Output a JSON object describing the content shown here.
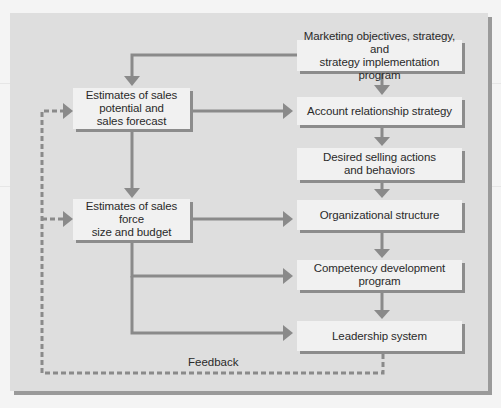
{
  "diagram": {
    "title": "",
    "colors": {
      "page_background": "#f4f4f4",
      "panel_background": "#dedede",
      "panel_shadow": "#9a9a9a",
      "box_fill": "#f1f1f1",
      "box_shadow": "#8c8c8c",
      "arrow": "#8a8a8a",
      "text": "#2a2a2a"
    },
    "nodes": {
      "marketing": "Marketing objectives, strategy, and\nstrategy implementation program",
      "sales_potential": "Estimates of sales\npotential and\nsales forecast",
      "sales_force": "Estimates of sales force\nsize and budget",
      "account": "Account relationship strategy",
      "selling": "Desired selling actions\nand behaviors",
      "organizational": "Organizational structure",
      "competency": "Competency development program",
      "leadership": "Leadership system"
    },
    "feedback_label": "Feedback",
    "edges": [
      {
        "from": "marketing",
        "to": "sales_potential",
        "style": "solid"
      },
      {
        "from": "marketing",
        "to": "account",
        "style": "solid"
      },
      {
        "from": "sales_potential",
        "to": "account",
        "style": "solid"
      },
      {
        "from": "sales_potential",
        "to": "sales_force",
        "style": "solid"
      },
      {
        "from": "account",
        "to": "selling",
        "style": "solid"
      },
      {
        "from": "selling",
        "to": "organizational",
        "style": "solid"
      },
      {
        "from": "sales_force",
        "to": "organizational",
        "style": "solid"
      },
      {
        "from": "sales_force",
        "to": "competency",
        "style": "solid"
      },
      {
        "from": "sales_force",
        "to": "leadership",
        "style": "solid"
      },
      {
        "from": "organizational",
        "to": "competency",
        "style": "solid"
      },
      {
        "from": "competency",
        "to": "leadership",
        "style": "solid"
      },
      {
        "from": "leadership",
        "to": "sales_potential",
        "style": "dashed",
        "label": "Feedback"
      },
      {
        "from": "leadership",
        "to": "sales_force",
        "style": "dashed",
        "label": "Feedback"
      }
    ]
  }
}
